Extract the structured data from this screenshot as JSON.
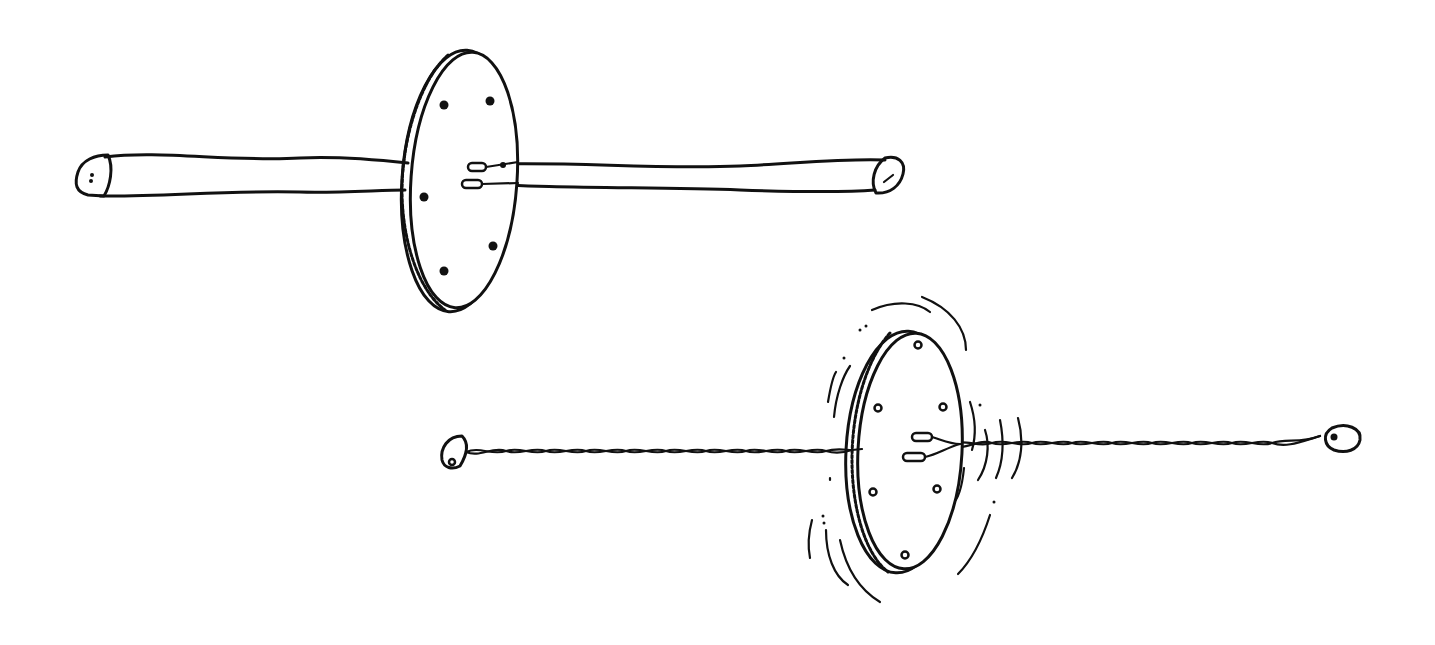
{
  "figure": {
    "panels": [
      {
        "name": "whirligig-at-rest",
        "state": "strings untwisted, disc still",
        "disc_holes": 6,
        "string_holes": 2,
        "cord": "loose untwisted loop"
      },
      {
        "name": "whirligig-spinning",
        "state": "strings twisted, disc spinning",
        "disc_holes": 6,
        "string_holes": 2,
        "cord": "twisted cord",
        "motion_lines": true
      }
    ],
    "colors": {
      "ink": "#111111",
      "paper": "#ffffff"
    }
  }
}
